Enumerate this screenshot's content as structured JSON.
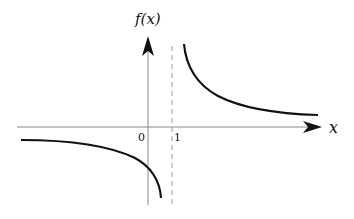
{
  "figure": {
    "type": "function graph with vertical asymptote",
    "y_axis_label": "f(x)",
    "x_axis_label": "x",
    "tick_labels": {
      "origin": "0",
      "asymptote": "1"
    },
    "asymptote": {
      "x": 1,
      "style": "dashed"
    },
    "branches": [
      {
        "name": "left-branch",
        "domain": "x < 1",
        "behavior": "approaches 0 from below as x → -∞, → -∞ as x → 1⁻"
      },
      {
        "name": "right-branch",
        "domain": "x > 1",
        "behavior": "→ +∞ as x → 1⁺, approaches 0 from above as x → +∞"
      }
    ],
    "colors": {
      "axis": "#888888",
      "curve": "#111111",
      "asymptote": "#999999"
    }
  }
}
